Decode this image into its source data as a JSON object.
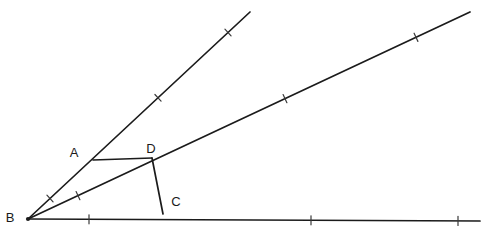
{
  "figure": {
    "background_color": "#ffffff",
    "stroke_color": "#1b1b1b",
    "tick_color": "#3a3a3a",
    "label_color": "#1a1a1a",
    "width": 491,
    "height": 235
  },
  "points": {
    "B": {
      "label": "B",
      "x": 28,
      "y": 219,
      "label_x": 10,
      "label_y": 219
    },
    "A": {
      "label": "A",
      "x": 93,
      "y": 160,
      "label_x": 74,
      "label_y": 154
    },
    "D": {
      "label": "D",
      "x": 152,
      "y": 158,
      "label_x": 151,
      "label_y": 150
    },
    "C": {
      "label": "C",
      "x": 163,
      "y": 214,
      "label_x": 176,
      "label_y": 203
    }
  },
  "rays": [
    {
      "name": "ray-bottom",
      "from_label": "B",
      "x1": 28,
      "y1": 219,
      "x2": 480,
      "y2": 221,
      "ticks": [
        {
          "x": 89,
          "y": 219.3
        },
        {
          "x": 311,
          "y": 220.3
        },
        {
          "x": 458,
          "y": 220.9
        }
      ],
      "tick_angle_deg": 90
    },
    {
      "name": "ray-middle",
      "from_label": "B",
      "x1": 28,
      "y1": 219,
      "x2": 470,
      "y2": 12,
      "ticks": [
        {
          "x": 78,
          "y": 195.6
        },
        {
          "x": 285,
          "y": 98.6
        },
        {
          "x": 416,
          "y": 37.3
        }
      ],
      "tick_angle_deg": 65
    },
    {
      "name": "ray-upper",
      "from_label": "B",
      "x1": 28,
      "y1": 219,
      "x2": 250,
      "y2": 12,
      "ticks": [
        {
          "x": 50,
          "y": 198.5
        },
        {
          "x": 158,
          "y": 97.8
        },
        {
          "x": 228,
          "y": 32.5
        }
      ],
      "tick_angle_deg": 47
    }
  ],
  "segments": [
    {
      "name": "segment-AD",
      "from_label": "A",
      "to_label": "D",
      "x1": 93,
      "y1": 160,
      "x2": 152,
      "y2": 158
    },
    {
      "name": "segment-DC",
      "from_label": "D",
      "to_label": "C",
      "x1": 152,
      "y1": 158,
      "x2": 163,
      "y2": 214
    }
  ],
  "tick_length": 9
}
